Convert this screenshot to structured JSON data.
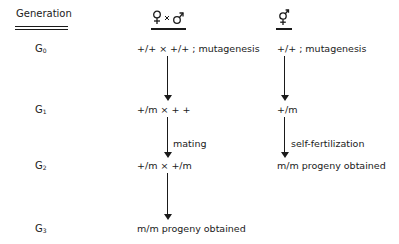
{
  "header": {
    "generation_label": "Generation",
    "cross_column_label": "♀ × ♂",
    "selfing_column_label": "⚥"
  },
  "generations": [
    {
      "prefix": "G",
      "sub": "0"
    },
    {
      "prefix": "G",
      "sub": "1"
    },
    {
      "prefix": "G",
      "sub": "2"
    },
    {
      "prefix": "G",
      "sub": "3"
    }
  ],
  "cross_column": {
    "g0": "+/+ × +/+ ; mutagenesis",
    "g1": "+/m × + +",
    "g1_g2_label": "mating",
    "g2": "+/m  ×  +/m",
    "g3": "m/m  progeny obtained"
  },
  "selfing_column": {
    "g0": "+/+ ; mutagenesis",
    "g1": "+/m",
    "g1_g2_label": "self-fertilization",
    "g2": "m/m  progeny obtained"
  },
  "icons": {
    "female_symbol": "venus-icon",
    "male_symbol": "mars-icon",
    "hermaphrodite_symbol": "hermaphrodite-icon"
  }
}
